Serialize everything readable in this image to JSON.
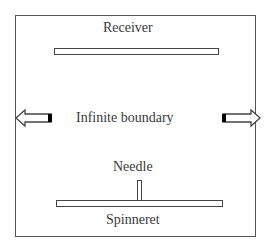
{
  "diagram": {
    "labels": {
      "receiver": "Receiver",
      "boundary": "Infinite boundary",
      "needle": "Needle",
      "spinneret": "Spinneret"
    },
    "arrows": [
      {
        "direction": "left",
        "name": "left-boundary-arrow"
      },
      {
        "direction": "right",
        "name": "right-boundary-arrow"
      }
    ],
    "colors": {
      "line": "#444444",
      "text": "#3a3a3a",
      "arrow_fill_end": "#000000"
    }
  }
}
